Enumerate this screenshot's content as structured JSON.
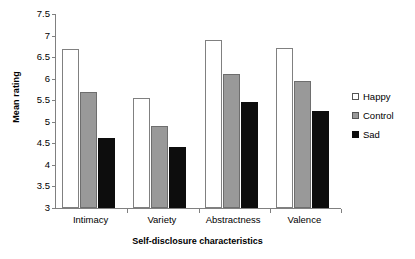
{
  "chart_data": {
    "type": "bar",
    "title": "",
    "xlabel": "Self-disclosure characteristics",
    "ylabel": "Mean rating",
    "categories": [
      "Intimacy",
      "Variety",
      "Abstractness",
      "Valence"
    ],
    "series": [
      {
        "name": "Happy",
        "color": "#ffffff",
        "values": [
          6.7,
          5.55,
          6.9,
          6.72
        ]
      },
      {
        "name": "Control",
        "color": "#999999",
        "values": [
          5.7,
          4.9,
          6.1,
          5.95
        ]
      },
      {
        "name": "Sad",
        "color": "#0d0d0d",
        "values": [
          4.62,
          4.42,
          5.45,
          5.25
        ]
      }
    ],
    "ylim": [
      3,
      7.5
    ],
    "ytick_labels": [
      "7.5",
      "7",
      "6.5",
      "6",
      "5.5",
      "5",
      "4.5",
      "4",
      "3.5",
      "3"
    ],
    "ytick_values": [
      7.5,
      7,
      6.5,
      6,
      5.5,
      5,
      4.5,
      4,
      3.5,
      3
    ],
    "grid": false,
    "legend_position": "right"
  }
}
